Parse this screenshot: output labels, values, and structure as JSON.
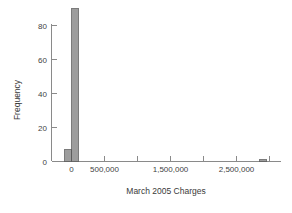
{
  "chart_data": {
    "type": "bar",
    "title": "",
    "subtitle": "",
    "xlabel": "March 2005 Charges",
    "ylabel": "Frequency",
    "xlim": [
      -250000,
      3250000
    ],
    "ylim": [
      0,
      93
    ],
    "grid": false,
    "legend": null,
    "x_ticks": [
      {
        "value": 0,
        "label": "0"
      },
      {
        "value": 500000,
        "label": "500,000"
      },
      {
        "value": 1000000,
        "label": ""
      },
      {
        "value": 1500000,
        "label": "1,500,000"
      },
      {
        "value": 2000000,
        "label": ""
      },
      {
        "value": 2500000,
        "label": "2,500,000"
      },
      {
        "value": 3000000,
        "label": ""
      }
    ],
    "y_ticks": [
      {
        "value": 0,
        "label": "0"
      },
      {
        "value": 20,
        "label": "20"
      },
      {
        "value": 40,
        "label": "40"
      },
      {
        "value": 60,
        "label": "60"
      },
      {
        "value": 80,
        "label": "80"
      }
    ],
    "bin_width": 100000,
    "bars": [
      {
        "x_left": -100000,
        "x_right": 0,
        "value": 7
      },
      {
        "x_left": 0,
        "x_right": 100000,
        "value": 90
      },
      {
        "x_left": 2850000,
        "x_right": 2950000,
        "value": 1
      }
    ],
    "categories": [
      "-100,000 to 0",
      "0 to 100,000",
      "2,850,000 to 2,950,000"
    ],
    "values": [
      7,
      90,
      1
    ],
    "colors": {
      "bar_fill": "#9d9d9d",
      "bar_stroke": "#5a5a5a",
      "axis": "#8a8a8a",
      "text": "#3f3f3f",
      "background": "#ffffff"
    }
  }
}
